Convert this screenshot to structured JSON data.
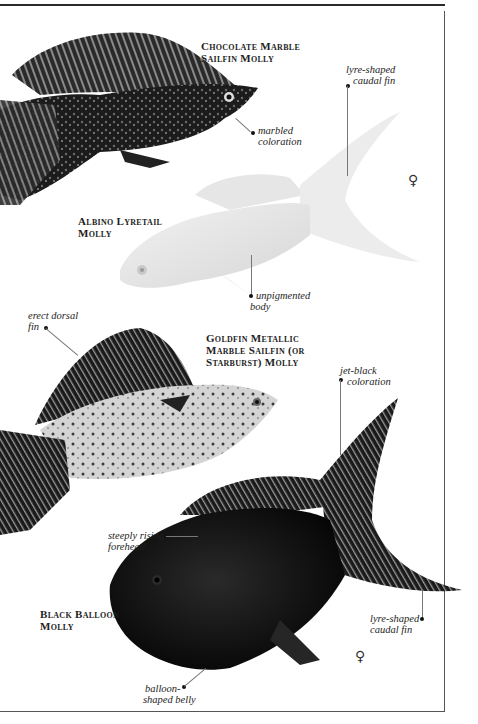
{
  "page": {
    "type": "field-guide-plate"
  },
  "species": [
    {
      "name_line1": "Chocolate Marble",
      "name_line2": "Sailfin Molly",
      "annotations": [
        {
          "line1": "marbled",
          "line2": "coloration"
        }
      ]
    },
    {
      "name_line1": "Albino Lyretail",
      "name_line2": "Molly",
      "sex_symbol": "♀",
      "annotations": [
        {
          "line1": "lyre-shaped",
          "line2": "caudal fin"
        },
        {
          "line1": "unpigmented",
          "line2": "body"
        }
      ]
    },
    {
      "name_line1": "Goldfin Metallic",
      "name_line2": "Marble Sailfin (or",
      "name_line3": "Starburst) Molly",
      "annotations": [
        {
          "line1": "erect dorsal",
          "line2": "fin"
        }
      ]
    },
    {
      "name_line1": "Black Balloon",
      "name_line2": "Molly",
      "sex_symbol": "♀",
      "annotations": [
        {
          "line1": "jet-black",
          "line2": "coloration"
        },
        {
          "line1": "steeply rising",
          "line2": "forehead"
        },
        {
          "line1": "lyre-shaped",
          "line2": "caudal fin"
        },
        {
          "line1": "balloon-",
          "line2": "shaped belly"
        }
      ]
    }
  ],
  "colors": {
    "background": "#ffffff",
    "text": "#1e1e1e",
    "chocolate_fish": "#1c1c1c",
    "albino_fish": "#ececec",
    "goldfin_fish": "#cfcfcf",
    "black_fish": "#0d0d0d"
  }
}
